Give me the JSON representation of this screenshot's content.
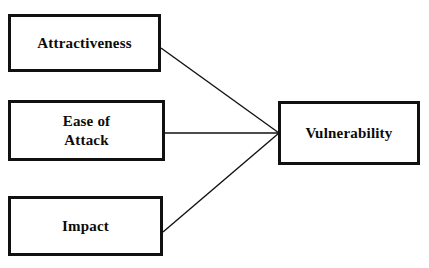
{
  "diagram": {
    "type": "convergent-factor-diagram",
    "background_color": "#ffffff",
    "line_color": "#111111",
    "text_color": "#0b0b0b",
    "nodes": [
      {
        "id": "attractiveness",
        "label": "Attractiveness",
        "role": "source-factor"
      },
      {
        "id": "ease_of_attack",
        "label": "Ease of\nAttack",
        "role": "source-factor"
      },
      {
        "id": "impact",
        "label": "Impact",
        "role": "source-factor"
      },
      {
        "id": "vulnerability",
        "label": "Vulnerability",
        "role": "target-outcome"
      }
    ],
    "connectors": [
      {
        "from": "attractiveness",
        "to": "vulnerability"
      },
      {
        "from": "ease_of_attack",
        "to": "vulnerability"
      },
      {
        "from": "impact",
        "to": "vulnerability"
      }
    ]
  }
}
